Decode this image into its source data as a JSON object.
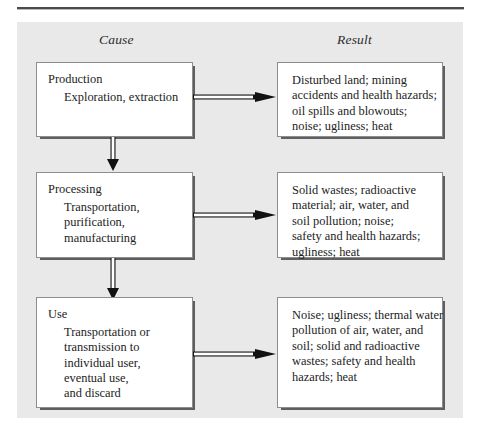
{
  "figure": {
    "headers": {
      "cause": "Cause",
      "result": "Result"
    },
    "colors": {
      "panel_background": "#e9e9e9",
      "box_background": "#ffffff",
      "box_border": "#8d8d8d",
      "box_shadow": "#5f5f5f",
      "text": "#1c1c1c",
      "rule": "#4a4a4a"
    },
    "stages": [
      {
        "id": "production",
        "cause": {
          "title": "Production",
          "sub_lines": [
            "Exploration, extraction"
          ]
        },
        "result": {
          "lines": [
            "Disturbed land; mining",
            "accidents and health hazards;",
            "oil spills and blowouts;",
            "noise; ugliness; heat"
          ]
        }
      },
      {
        "id": "processing",
        "cause": {
          "title": "Processing",
          "sub_lines": [
            "Transportation,",
            "purification,",
            "manufacturing"
          ]
        },
        "result": {
          "lines": [
            "Solid wastes; radioactive",
            "material; air, water, and",
            "soil pollution; noise;",
            "safety and health hazards;",
            "ugliness; heat"
          ]
        }
      },
      {
        "id": "use",
        "cause": {
          "title": "Use",
          "sub_lines": [
            "Transportation or",
            "transmission to",
            "individual user,",
            "eventual use,",
            "and discard"
          ]
        },
        "result": {
          "lines": [
            "Noise; ugliness; thermal water",
            "pollution of air, water, and",
            "soil; solid and radioactive",
            "wastes; safety and health",
            "hazards; heat"
          ]
        }
      }
    ],
    "arrows": {
      "horizontal_label": "cause-to-result",
      "vertical_label": "stage-to-next-stage"
    }
  }
}
